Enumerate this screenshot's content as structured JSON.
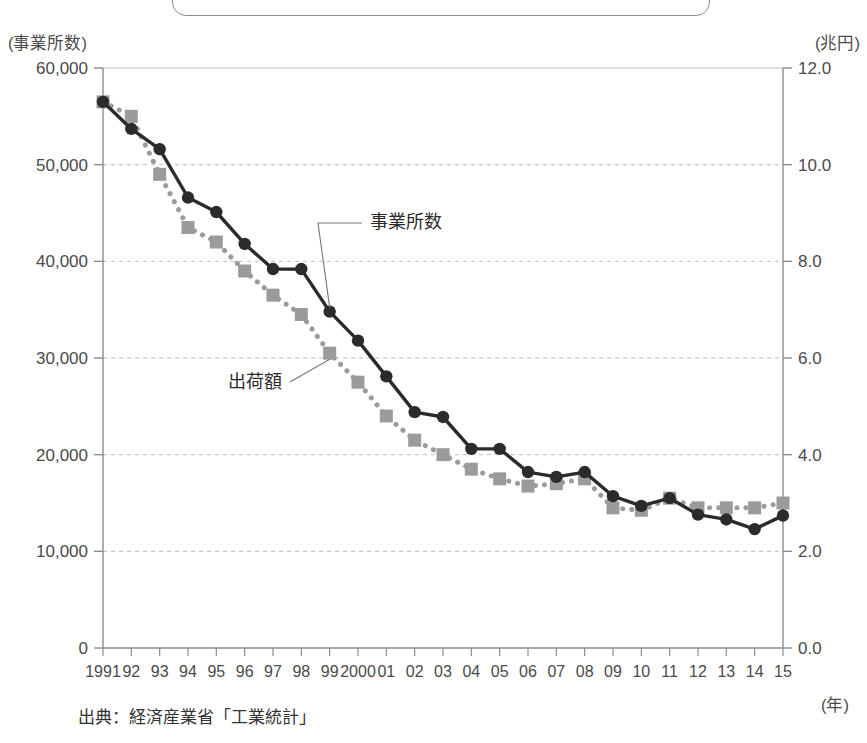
{
  "figure": {
    "title_box_present": true,
    "source_note": "出典：経済産業省「工業統計」",
    "left_axis_unit": "(事業所数)",
    "right_axis_unit": "(兆円)",
    "x_axis_unit": "(年)"
  },
  "chart_data": {
    "type": "line",
    "title": "",
    "xlabel": "(年)",
    "ylabel": "(事業所数)",
    "y2label": "(兆円)",
    "grid": true,
    "legend_position": "inline-annotation",
    "categories": [
      "1991",
      "92",
      "93",
      "94",
      "95",
      "96",
      "97",
      "98",
      "99",
      "2000",
      "01",
      "02",
      "03",
      "04",
      "05",
      "06",
      "07",
      "08",
      "09",
      "10",
      "11",
      "12",
      "13",
      "14",
      "15"
    ],
    "x_values": [
      1991,
      1992,
      1993,
      1994,
      1995,
      1996,
      1997,
      1998,
      1999,
      2000,
      2001,
      2002,
      2003,
      2004,
      2005,
      2006,
      2007,
      2008,
      2009,
      2010,
      2011,
      2012,
      2013,
      2014,
      2015
    ],
    "ylim": [
      0,
      60000
    ],
    "yticks": [
      "0",
      "10,000",
      "20,000",
      "30,000",
      "40,000",
      "50,000",
      "60,000"
    ],
    "ytick_values": [
      0,
      10000,
      20000,
      30000,
      40000,
      50000,
      60000
    ],
    "y2lim": [
      0.0,
      12.0
    ],
    "y2ticks": [
      "0.0",
      "2.0",
      "4.0",
      "6.0",
      "8.0",
      "10.0",
      "12.0"
    ],
    "y2tick_values": [
      0.0,
      2.0,
      4.0,
      6.0,
      8.0,
      10.0,
      12.0
    ],
    "series": [
      {
        "name": "事業所数",
        "axis": "left",
        "color": "#2b2b2b",
        "marker": "circle",
        "line_style": "solid",
        "values": [
          56500,
          53700,
          51600,
          46600,
          45100,
          41800,
          39200,
          39200,
          34800,
          31800,
          28100,
          24400,
          23900,
          20600,
          20600,
          18200,
          17700,
          18200,
          15700,
          14700,
          15500,
          13800,
          13300,
          12300,
          13700
        ]
      },
      {
        "name": "出荷額",
        "axis": "right",
        "color": "#9b9b9b",
        "marker": "square",
        "line_style": "dotted",
        "values": [
          11.3,
          11.0,
          9.8,
          8.7,
          8.4,
          7.8,
          7.3,
          6.9,
          6.1,
          5.5,
          4.8,
          4.3,
          4.0,
          3.7,
          3.5,
          3.35,
          3.4,
          3.5,
          2.9,
          2.85,
          3.1,
          2.9,
          2.9,
          2.9,
          3.0
        ]
      }
    ],
    "annotations": [
      {
        "text": "事業所数",
        "target_series": "事業所数",
        "x": 370,
        "y": 228
      },
      {
        "text": "出荷額",
        "target_series": "出荷額",
        "x": 228,
        "y": 388
      }
    ]
  }
}
